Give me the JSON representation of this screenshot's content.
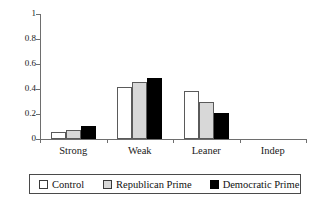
{
  "chart_data": {
    "type": "bar",
    "title": "",
    "xlabel": "",
    "ylabel": "",
    "ylim": [
      0,
      1
    ],
    "grid": false,
    "legend_position": "bottom",
    "categories": [
      "Strong",
      "Weak",
      "Leaner",
      "Indep"
    ],
    "ytick_labels": [
      "0",
      "0.2",
      "0.4",
      "0.6",
      "0.8",
      "1"
    ],
    "ytick_values": [
      0,
      0.2,
      0.4,
      0.6,
      0.8,
      1
    ],
    "series": [
      {
        "name": "Control",
        "color": "#ffffff",
        "values": [
          0.055,
          0.415,
          0.385,
          0.0
        ]
      },
      {
        "name": "Republican Prime",
        "color": "#d8d8d8",
        "values": [
          0.07,
          0.455,
          0.3,
          0.0
        ]
      },
      {
        "name": "Democratic Prime",
        "color": "#000000",
        "values": [
          0.105,
          0.49,
          0.21,
          0.0
        ]
      }
    ]
  },
  "legend": {
    "entries": [
      {
        "label": "Control",
        "swatch": "white-square-icon"
      },
      {
        "label": "Republican Prime",
        "swatch": "gray-square-icon"
      },
      {
        "label": "Democratic Prime",
        "swatch": "black-square-icon"
      }
    ]
  },
  "colors": {
    "control_fill": "#ffffff",
    "republican_fill": "#d8d8d8",
    "democratic_fill": "#000000",
    "bar_outline": "#5a5a5a",
    "axis": "#6e6e6e",
    "text": "#1a1a1a",
    "background": "#ffffff"
  }
}
